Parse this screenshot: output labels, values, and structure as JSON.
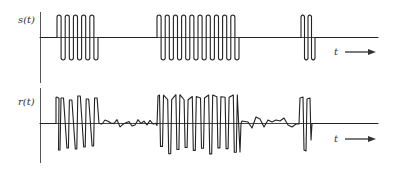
{
  "figure": {
    "panels": [
      {
        "id": "transmitted",
        "label": "s(t)",
        "axis_label": "t",
        "description": "Transmitted on-off keyed burst signal",
        "bursts": [
          {
            "start": 57,
            "cycles": 5,
            "period": 8.2
          },
          {
            "start": 157,
            "cycles": 10,
            "period": 8.2
          },
          {
            "start": 301,
            "cycles": 2,
            "period": 7
          }
        ]
      },
      {
        "id": "received",
        "label": "r(t)",
        "axis_label": "t",
        "description": "Received noisy signal"
      }
    ],
    "colors": {
      "signal": "#222222",
      "axis": "#555555",
      "background": "#ffffff"
    }
  }
}
